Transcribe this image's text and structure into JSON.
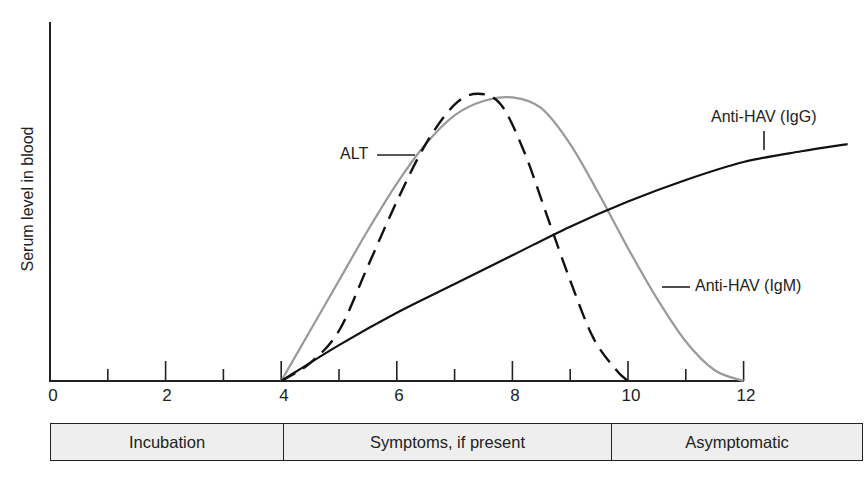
{
  "chart_data": {
    "type": "line",
    "title": "",
    "xlabel": "",
    "ylabel": "Serum level in blood",
    "xlim": [
      0,
      14
    ],
    "ylim": [
      0,
      100
    ],
    "x_ticks": [
      0,
      2,
      4,
      6,
      8,
      10,
      12
    ],
    "x_minor_ticks": [
      1,
      3,
      5,
      7,
      9,
      11
    ],
    "grid": false,
    "legend": "inline labels",
    "series": [
      {
        "name": "ALT",
        "style": "dashed",
        "color": "#111111",
        "x": [
          4,
          4.5,
          5,
          5.5,
          6,
          6.5,
          7,
          7.4,
          7.8,
          8.2,
          8.6,
          9,
          9.4,
          9.8,
          10
        ],
        "y": [
          0,
          5,
          14,
          32,
          50,
          66,
          77,
          80,
          77,
          64,
          46,
          28,
          12,
          3,
          0
        ]
      },
      {
        "name": "Anti-HAV (IgM)",
        "style": "solid",
        "color": "#999999",
        "x": [
          4,
          4.5,
          5,
          5.5,
          6,
          6.5,
          7,
          7.5,
          8,
          8.5,
          9,
          9.5,
          10,
          10.5,
          11,
          11.5,
          12
        ],
        "y": [
          0,
          14,
          28,
          42,
          55,
          66,
          74,
          78,
          79,
          76,
          66,
          52,
          37,
          23,
          11,
          3,
          0
        ]
      },
      {
        "name": "Anti-HAV (IgG)",
        "style": "solid",
        "color": "#111111",
        "x": [
          4,
          5,
          6,
          7,
          8,
          9,
          10,
          11,
          12,
          13,
          13.8
        ],
        "y": [
          0,
          10,
          19,
          27,
          35,
          43,
          50,
          56,
          61,
          64,
          66
        ]
      }
    ],
    "annotations": [
      {
        "text": "ALT",
        "x": 6.4,
        "y": 62
      },
      {
        "text": "Anti-HAV (IgG)",
        "x": 12.7,
        "y": 72
      },
      {
        "text": "Anti-HAV (IgM)",
        "x": 10.5,
        "y": 26
      }
    ],
    "phases": [
      {
        "label": "Incubation",
        "from": 0,
        "to": 4
      },
      {
        "label": "Symptoms, if present",
        "from": 4,
        "to": 9.7
      },
      {
        "label": "Asymptomatic",
        "from": 9.7,
        "to": 14
      }
    ]
  },
  "labels": {
    "ylabel": "Serum level in blood",
    "ticks": [
      "0",
      "2",
      "4",
      "6",
      "8",
      "10",
      "12"
    ],
    "alt": "ALT",
    "igg": "Anti-HAV (IgG)",
    "igm": "Anti-HAV (IgM)",
    "phases": [
      "Incubation",
      "Symptoms, if present",
      "Asymptomatic"
    ]
  }
}
